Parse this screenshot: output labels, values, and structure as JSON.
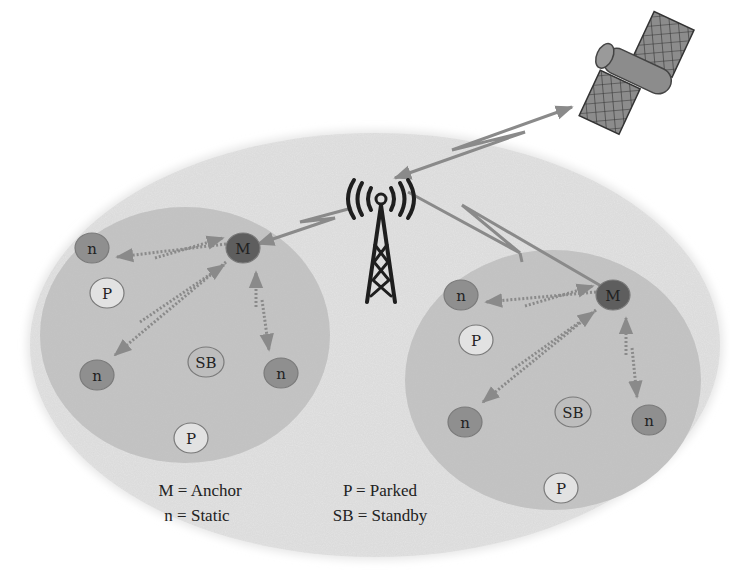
{
  "diagram": {
    "type": "network-topology",
    "colors": {
      "background": "#ffffff",
      "outer_cloud": "#e6e6e6",
      "cluster_fill": "#c4c4c4",
      "anchor_node": "#5e5e5e",
      "static_node": "#8f8f8f",
      "parked_node": "#e2e2e2",
      "standby_node": "#bdbdbd",
      "link": "#8a8a8a",
      "tower": "#1e1e1e",
      "satellite": "#8c8c8c"
    },
    "infrastructure": {
      "satellite": {
        "name": "satellite"
      },
      "tower": {
        "name": "cell-tower"
      }
    },
    "clusters": [
      {
        "id": "left-cluster",
        "nodes": [
          {
            "label": "M",
            "role": "anchor",
            "x": 243,
            "y": 248
          },
          {
            "label": "n",
            "role": "static",
            "x": 92,
            "y": 248
          },
          {
            "label": "P",
            "role": "parked",
            "x": 107,
            "y": 293
          },
          {
            "label": "n",
            "role": "static",
            "x": 97,
            "y": 375
          },
          {
            "label": "SB",
            "role": "standby",
            "x": 206,
            "y": 362
          },
          {
            "label": "n",
            "role": "static",
            "x": 281,
            "y": 373
          },
          {
            "label": "P",
            "role": "parked",
            "x": 191,
            "y": 438
          }
        ]
      },
      {
        "id": "right-cluster",
        "nodes": [
          {
            "label": "M",
            "role": "anchor",
            "x": 613,
            "y": 295
          },
          {
            "label": "n",
            "role": "static",
            "x": 461,
            "y": 295
          },
          {
            "label": "P",
            "role": "parked",
            "x": 476,
            "y": 340
          },
          {
            "label": "n",
            "role": "static",
            "x": 465,
            "y": 422
          },
          {
            "label": "SB",
            "role": "standby",
            "x": 573,
            "y": 412
          },
          {
            "label": "n",
            "role": "static",
            "x": 649,
            "y": 420
          },
          {
            "label": "P",
            "role": "parked",
            "x": 561,
            "y": 488
          }
        ]
      }
    ],
    "legend": {
      "items": [
        {
          "key": "M",
          "text": "M = Anchor"
        },
        {
          "key": "n",
          "text": "n = Static"
        },
        {
          "key": "P",
          "text": "P = Parked"
        },
        {
          "key": "SB",
          "text": "SB = Standby"
        }
      ]
    }
  }
}
